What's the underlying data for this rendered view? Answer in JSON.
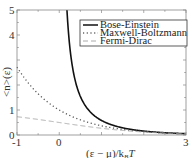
{
  "chart_data": {
    "type": "line",
    "title": "",
    "xlabel": "(ε − μ)/k_B T",
    "ylabel": "<n>(ε)",
    "xlim": [
      -1,
      3
    ],
    "ylim": [
      0,
      5
    ],
    "x_ticks": [
      "-1",
      "0",
      "3"
    ],
    "y_ticks": [
      "0",
      "1",
      "4",
      "5"
    ],
    "grid": false,
    "legend_position": "upper right",
    "series": [
      {
        "name": "Bose-Einstein",
        "style": "solid",
        "color": "#111111",
        "formula": "1/(exp(x)-1)",
        "x": [
          0.2,
          0.25,
          0.3,
          0.4,
          0.5,
          0.75,
          1.0,
          1.5,
          2.0,
          2.5,
          3.0
        ],
        "values": [
          4.52,
          3.52,
          2.86,
          2.03,
          1.54,
          0.9,
          0.58,
          0.29,
          0.16,
          0.09,
          0.05
        ]
      },
      {
        "name": "Maxwell-Boltzmann",
        "style": "dotted",
        "color": "#555555",
        "formula": "exp(-x)",
        "x": [
          -1,
          -0.5,
          0,
          0.5,
          1.0,
          1.5,
          2.0,
          2.5,
          3.0
        ],
        "values": [
          2.72,
          1.65,
          1.0,
          0.61,
          0.37,
          0.22,
          0.14,
          0.08,
          0.05
        ]
      },
      {
        "name": "Fermi-Dirac",
        "style": "dashed",
        "color": "#aaaaaa",
        "formula": "1/(exp(x)+1)",
        "x": [
          -1,
          -0.5,
          0,
          0.5,
          1.0,
          1.5,
          2.0,
          2.5,
          3.0
        ],
        "values": [
          0.73,
          0.62,
          0.5,
          0.38,
          0.27,
          0.18,
          0.12,
          0.08,
          0.05
        ]
      }
    ]
  },
  "axes": {
    "xlabel_text": "(ε − μ)/k",
    "xlabel_sub": "B",
    "xlabel_tail": "T",
    "ylabel_text": "<n>(ε)",
    "x_tick_labels": [
      {
        "v": -1,
        "t": "-1"
      },
      {
        "v": 0,
        "t": "0"
      },
      {
        "v": 3,
        "t": "3"
      }
    ],
    "y_tick_labels": [
      {
        "v": 0,
        "t": "0"
      },
      {
        "v": 1,
        "t": "1"
      },
      {
        "v": 4,
        "t": "4"
      },
      {
        "v": 5,
        "t": "5"
      }
    ]
  },
  "legend": {
    "items": [
      "Bose-Einstein",
      "Maxwell-Boltzmann",
      "Fermi-Dirac"
    ]
  }
}
